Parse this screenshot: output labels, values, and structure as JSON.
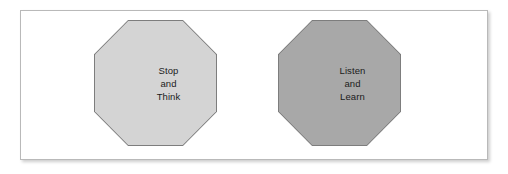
{
  "figure": {
    "background_color": "#ffffff",
    "panel": {
      "background_color": "#ffffff",
      "border_color": "#b9b9b9"
    },
    "shapes": [
      {
        "id": "stop-think",
        "type": "octagon",
        "fill_color": "#d4d4d4",
        "border_color": "#7d7d7d",
        "lines": [
          "Stop",
          "and",
          "Think"
        ]
      },
      {
        "id": "listen-learn",
        "type": "octagon",
        "fill_color": "#a8a8a8",
        "border_color": "#7d7d7d",
        "lines": [
          "Listen",
          "and",
          "Learn"
        ]
      }
    ]
  }
}
